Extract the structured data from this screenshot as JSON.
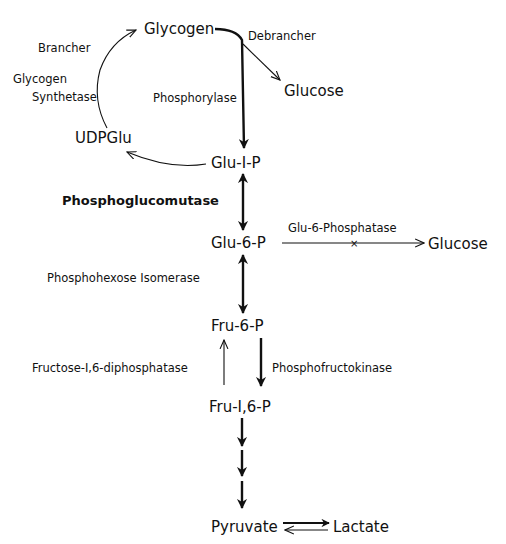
{
  "diagram": {
    "type": "metabolic-pathway",
    "colors": {
      "ink": "#111111",
      "background": "#ffffff"
    },
    "nodes": {
      "glycogen": "Glycogen",
      "glucose_top": "Glucose",
      "udpglu": "UDPGlu",
      "glu1p": "Glu-I-P",
      "glu6p": "Glu-6-P",
      "glucose_right": "Glucose",
      "fru6p": "Fru-6-P",
      "fru16p": "Fru-I,6-P",
      "pyruvate": "Pyruvate",
      "lactate": "Lactate"
    },
    "enzymes": {
      "brancher": "Brancher",
      "glycogen_synthetase_1": "Glycogen",
      "glycogen_synthetase_2": "Synthetase",
      "debrancher": "Debrancher",
      "phosphorylase": "Phosphorylase",
      "phosphoglucomutase": "Phosphoglucomutase",
      "glu6phosphatase": "Glu-6-Phosphatase",
      "phosphohexose_isomerase": "Phosphohexose Isomerase",
      "fructose_diphosphatase": "Fructose-I,6-diphosphatase",
      "phosphofructokinase": "Phosphofructokinase"
    },
    "edges": [
      {
        "from": "Glycogen",
        "to": "Glu-I-P",
        "enzyme": "Phosphorylase",
        "style": "bold"
      },
      {
        "from": "Glycogen",
        "to": "Glucose",
        "enzyme": "Debrancher",
        "style": "thin"
      },
      {
        "from": "Glu-I-P",
        "to": "UDPGlu",
        "style": "thin"
      },
      {
        "from": "UDPGlu",
        "to": "Glycogen",
        "enzyme": "Glycogen Synthetase / Brancher",
        "style": "thin"
      },
      {
        "from": "Glu-I-P",
        "to": "Glu-6-P",
        "enzyme": "Phosphoglucomutase",
        "style": "bold-bidirectional"
      },
      {
        "from": "Glu-6-P",
        "to": "Glucose",
        "enzyme": "Glu-6-Phosphatase",
        "style": "thin-blocked"
      },
      {
        "from": "Glu-6-P",
        "to": "Fru-6-P",
        "enzyme": "Phosphohexose Isomerase",
        "style": "bold-bidirectional"
      },
      {
        "from": "Fru-6-P",
        "to": "Fru-I,6-P",
        "enzyme": "Phosphofructokinase",
        "style": "bold"
      },
      {
        "from": "Fru-I,6-P",
        "to": "Fru-6-P",
        "enzyme": "Fructose-I,6-diphosphatase",
        "style": "thin"
      },
      {
        "from": "Fru-I,6-P",
        "to": "Pyruvate",
        "style": "bold-multistep"
      },
      {
        "from": "Pyruvate",
        "to": "Lactate",
        "style": "equilibrium"
      }
    ]
  }
}
